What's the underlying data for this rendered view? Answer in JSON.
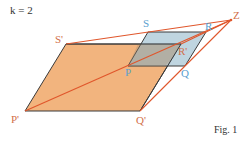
{
  "title": "k = 2",
  "caption": "Fig. 1",
  "scale_factor": 2,
  "colors": {
    "image_fill": "#f2b47e",
    "object_fill": "#a9c7d6",
    "overlap_fill": "#b8a58c",
    "ray_color": "#e0562b",
    "edge_color": "#3a3a3a",
    "image_label_color": "#d2704a",
    "object_label_color": "#5aa0cf"
  },
  "center": {
    "label": "Z",
    "x": 231,
    "y": 20
  },
  "object_shape": {
    "name": "PQRS",
    "vertices": [
      {
        "label": "P",
        "x": 128,
        "y": 66
      },
      {
        "label": "Q",
        "x": 185,
        "y": 66
      },
      {
        "label": "R",
        "x": 206,
        "y": 32
      },
      {
        "label": "S",
        "x": 148,
        "y": 32
      }
    ]
  },
  "image_shape": {
    "name": "P'Q'R'S'",
    "vertices": [
      {
        "label": "P'",
        "x": 25,
        "y": 111
      },
      {
        "label": "Q'",
        "x": 140,
        "y": 111
      },
      {
        "label": "R'",
        "x": 181,
        "y": 44
      },
      {
        "label": "S'",
        "x": 66,
        "y": 44
      }
    ]
  },
  "labels": {
    "Z": "Z",
    "P": "P",
    "Q": "Q",
    "R": "R",
    "S": "S",
    "P_prime": "P'",
    "Q_prime": "Q'",
    "R_prime": "R'",
    "S_prime": "S'"
  }
}
